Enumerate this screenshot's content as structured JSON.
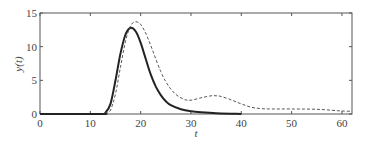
{
  "chart_data": {
    "type": "line",
    "title": "",
    "xlabel": "t",
    "ylabel": "y(t)",
    "xlim": [
      0,
      62
    ],
    "ylim": [
      0,
      15
    ],
    "grid": false,
    "legend": null,
    "x_ticks": [
      0,
      10,
      20,
      30,
      40,
      50,
      60
    ],
    "y_ticks": [
      0,
      5,
      10,
      15
    ],
    "x_tick_labels": [
      "0",
      "10",
      "20",
      "30",
      "40",
      "50",
      "60"
    ],
    "y_tick_labels": [
      "0",
      "5",
      "10",
      "15"
    ],
    "series": [
      {
        "name": "solid",
        "style": "solid",
        "color": "#222222",
        "x": [
          0,
          12,
          13,
          14,
          15,
          16,
          17,
          18,
          19,
          20,
          21,
          22,
          23,
          24,
          25,
          26,
          28,
          30,
          32,
          35,
          38,
          40
        ],
        "y": [
          0,
          0,
          0.2,
          1.5,
          5.0,
          9.0,
          11.8,
          12.8,
          12.3,
          10.6,
          8.2,
          5.9,
          4.1,
          2.8,
          1.9,
          1.3,
          0.7,
          0.4,
          0.25,
          0.12,
          0.05,
          0.02
        ]
      },
      {
        "name": "dashed",
        "style": "dashed",
        "color": "#444444",
        "x": [
          13,
          14,
          15,
          16,
          17,
          18,
          19,
          20,
          21,
          22,
          23,
          24,
          25,
          26,
          27,
          28,
          29,
          30,
          32,
          34,
          35,
          36,
          38,
          40,
          42,
          44,
          46,
          50,
          55,
          58,
          60,
          62
        ],
        "y": [
          0,
          0.6,
          3.0,
          7.0,
          10.8,
          13.1,
          13.7,
          13.3,
          12.0,
          10.2,
          8.2,
          6.3,
          4.8,
          3.7,
          2.9,
          2.4,
          2.1,
          2.05,
          2.4,
          2.7,
          2.7,
          2.6,
          2.1,
          1.5,
          1.0,
          0.8,
          0.75,
          0.75,
          0.7,
          0.55,
          0.45,
          0.4
        ]
      }
    ]
  }
}
